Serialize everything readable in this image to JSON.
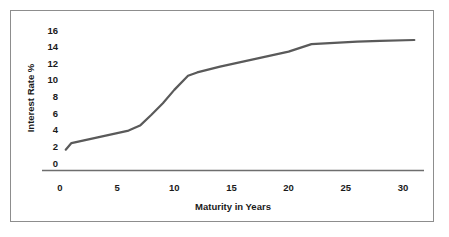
{
  "figure": {
    "border_color": "#8d8d8d",
    "background": "#ffffff"
  },
  "chart_data": {
    "type": "line",
    "title": "",
    "subtitle": "",
    "xlabel": "Maturity in Years",
    "ylabel": "Interest Rate %",
    "xlim": [
      0,
      32
    ],
    "ylim": [
      0,
      16
    ],
    "xticks": [
      0,
      5,
      10,
      15,
      20,
      25,
      30
    ],
    "xtick_labels": [
      "0",
      "5",
      "10",
      "15",
      "20",
      "25",
      "30"
    ],
    "yticks": [
      0,
      2,
      4,
      6,
      8,
      10,
      12,
      14,
      16
    ],
    "ytick_labels": [
      "0",
      "2",
      "4",
      "6",
      "8",
      "10",
      "12",
      "14",
      "16"
    ],
    "grid": false,
    "legend": false,
    "legend_position": "none",
    "line_color": "#5a5a5a",
    "line_width": 2.2,
    "series": [
      {
        "name": "Yield Curve",
        "x": [
          0.5,
          1.0,
          2.0,
          3.0,
          4.0,
          5.0,
          6.0,
          7.0,
          8.0,
          9.0,
          10.0,
          11.2,
          12.0,
          14.0,
          16.0,
          18.0,
          20.0,
          22.0,
          24.0,
          26.0,
          28.0,
          31.0
        ],
        "y": [
          1.6,
          2.4,
          2.7,
          3.0,
          3.3,
          3.6,
          3.9,
          4.5,
          5.8,
          7.2,
          8.8,
          10.5,
          10.9,
          11.6,
          12.2,
          12.8,
          13.4,
          14.3,
          14.45,
          14.6,
          14.7,
          14.8
        ]
      }
    ]
  },
  "axes_geometry": {
    "x_pixel_at_zero": 60,
    "x_pixels_per_unit": 11.43,
    "y_pixel_at_zero": 163,
    "y_pixels_per_unit": 8.31,
    "axis_line_y": 170,
    "axis_line_x_start": 42,
    "axis_line_x_end": 424
  }
}
